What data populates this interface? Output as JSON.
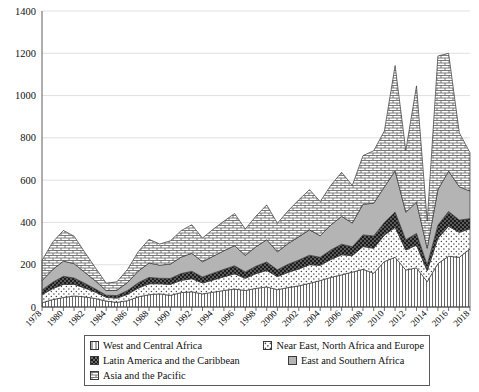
{
  "chart_data": {
    "type": "area",
    "stacked": true,
    "title": "",
    "subtitle": "",
    "xlabel": "",
    "ylabel": "",
    "grid": true,
    "legend_position": "bottom",
    "ylim": [
      0,
      1400
    ],
    "yticks": [
      0,
      200,
      400,
      600,
      800,
      1000,
      1200,
      1400
    ],
    "xlim": [
      1978,
      2018
    ],
    "x": [
      1978,
      1979,
      1980,
      1981,
      1982,
      1983,
      1984,
      1985,
      1986,
      1987,
      1988,
      1989,
      1990,
      1991,
      1992,
      1993,
      1994,
      1995,
      1996,
      1997,
      1998,
      1999,
      2000,
      2001,
      2002,
      2003,
      2004,
      2005,
      2006,
      2007,
      2008,
      2009,
      2010,
      2011,
      2012,
      2013,
      2014,
      2015,
      2016,
      2017,
      2018
    ],
    "xtick_labels": [
      "1978",
      "1980",
      "1982",
      "1984",
      "1986",
      "1988",
      "1990",
      "1992",
      "1994",
      "1996",
      "1998",
      "2000",
      "2002",
      "2004",
      "2006",
      "2008",
      "2010",
      "2012",
      "2014",
      "2016",
      "2018"
    ],
    "series": [
      {
        "name": "West and Central Africa",
        "pattern": "vertical-lines",
        "values": [
          20,
          35,
          45,
          52,
          48,
          40,
          28,
          22,
          30,
          48,
          58,
          62,
          55,
          68,
          72,
          62,
          70,
          78,
          85,
          78,
          88,
          95,
          82,
          92,
          100,
          112,
          125,
          140,
          152,
          165,
          178,
          160,
          215,
          235,
          175,
          185,
          120,
          205,
          240,
          235,
          275
        ]
      },
      {
        "name": "Near East, North Africa and Europe",
        "pattern": "dots",
        "values": [
          38,
          52,
          62,
          55,
          42,
          30,
          18,
          20,
          30,
          42,
          52,
          48,
          52,
          58,
          62,
          52,
          58,
          65,
          72,
          58,
          70,
          78,
          62,
          72,
          80,
          88,
          72,
          85,
          95,
          78,
          108,
          118,
          125,
          142,
          95,
          108,
          52,
          120,
          142,
          118,
          95
        ]
      },
      {
        "name": "Latin America and the Caribbean",
        "pattern": "checker",
        "values": [
          22,
          30,
          38,
          30,
          22,
          15,
          10,
          12,
          18,
          25,
          30,
          26,
          28,
          32,
          35,
          28,
          32,
          35,
          38,
          30,
          35,
          40,
          32,
          38,
          42,
          45,
          38,
          45,
          50,
          42,
          55,
          58,
          60,
          72,
          48,
          55,
          28,
          62,
          70,
          58,
          48
        ]
      },
      {
        "name": "East and Southern Africa",
        "pattern": "solid-grey",
        "values": [
          45,
          60,
          72,
          68,
          52,
          38,
          22,
          25,
          38,
          55,
          68,
          62,
          68,
          78,
          85,
          72,
          80,
          88,
          95,
          78,
          92,
          105,
          85,
          98,
          110,
          120,
          102,
          118,
          132,
          112,
          145,
          155,
          168,
          195,
          130,
          148,
          78,
          168,
          190,
          158,
          130
        ]
      },
      {
        "name": "Asia and the Pacific",
        "pattern": "brick",
        "values": [
          95,
          130,
          145,
          130,
          95,
          62,
          35,
          40,
          62,
          92,
          112,
          100,
          110,
          125,
          135,
          112,
          128,
          140,
          152,
          125,
          145,
          165,
          135,
          155,
          175,
          190,
          162,
          188,
          208,
          178,
          230,
          248,
          265,
          498,
          292,
          550,
          128,
          632,
          558,
          255,
          182
        ]
      }
    ]
  },
  "legend": {
    "items": [
      {
        "label": "West and Central Africa",
        "pattern": "vertical-lines"
      },
      {
        "label": "Near East, North Africa and Europe",
        "pattern": "dots"
      },
      {
        "label": "Latin America and the Caribbean",
        "pattern": "checker"
      },
      {
        "label": "East and Southern Africa",
        "pattern": "solid-grey"
      },
      {
        "label": "Asia and the Pacific",
        "pattern": "brick"
      }
    ]
  },
  "colors": {
    "grid": "#d8d8d8",
    "axis": "#4a4a4a",
    "text": "#111111",
    "grey_fill": "#b4b4b4",
    "black_fill": "#1c1c1c",
    "white_fill": "#ffffff"
  }
}
